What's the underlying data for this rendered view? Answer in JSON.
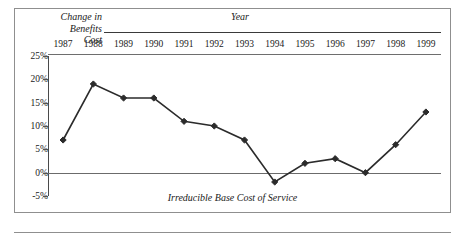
{
  "figure": {
    "y_axis_title": "Change in\nBenefits\nCost",
    "x_axis_title": "Year",
    "caption": "Irreducible Base Cost of Service",
    "frame_color": "#8f8f8f",
    "line_color": "#2b2b2b",
    "marker_shape": "diamond"
  },
  "chart_data": {
    "type": "line",
    "title": "",
    "subtitle": "",
    "xlabel": "Year",
    "ylabel": "Change in Benefits Cost",
    "annotation": "Irreducible Base Cost of Service",
    "categories": [
      "1987",
      "1988",
      "1989",
      "1990",
      "1991",
      "1992",
      "1993",
      "1994",
      "1995",
      "1996",
      "1997",
      "1998",
      "1999"
    ],
    "values": [
      7,
      19,
      16,
      16,
      11,
      10,
      7,
      -2,
      2,
      3,
      0,
      6,
      13
    ],
    "value_unit": "percent",
    "ytick_labels": [
      "25%",
      "20%",
      "15%",
      "10%",
      "5%",
      "0%",
      "-5%"
    ],
    "ytick_values": [
      25,
      20,
      15,
      10,
      5,
      0,
      -5
    ],
    "ylim": [
      -5,
      25
    ],
    "grid": false,
    "zero_line": true,
    "legend": null,
    "series": [
      {
        "name": "Change in Benefits Cost",
        "values": [
          7,
          19,
          16,
          16,
          11,
          10,
          7,
          -2,
          2,
          3,
          0,
          6,
          13
        ]
      }
    ]
  }
}
